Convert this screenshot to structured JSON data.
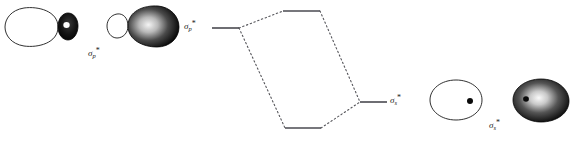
{
  "figure": {
    "background_color": "#ffffff",
    "width": 575,
    "height": 141,
    "stroke_color": "#1a1a1a",
    "dash_color": "#55555a",
    "fill_dark": "#0a0a0a",
    "fill_light": "#ffffff"
  },
  "labels": {
    "orbital_left": {
      "symbol": "σ",
      "subscript": "p",
      "superscript": "*",
      "text": "σp*"
    },
    "level_sigma_p_star": {
      "symbol": "σ",
      "subscript": "p",
      "superscript": "*",
      "text": "σp*"
    },
    "level_sigma_s_star": {
      "symbol": "σ",
      "subscript": "s",
      "superscript": "*",
      "text": "σs*"
    },
    "orbital_right": {
      "symbol": "σ",
      "subscript": "s",
      "superscript": "*",
      "text": "σs*"
    }
  },
  "orbitals": [
    {
      "name": "sigma-p-star-orbital-outline",
      "style": "outline",
      "description": "large white teardrop lobe pointing right joined to small black lobe with white nucleus dot",
      "big_lobe_fill": "#ffffff",
      "small_lobe_fill": "#0a0a0a",
      "nucleus_fill": "#ffffff"
    },
    {
      "name": "sigma-p-star-orbital-shaded",
      "style": "shaded",
      "description": "small white lobe at left joined to large black shaded teardrop pointing right",
      "big_lobe_fill": "#0a0a0a",
      "small_lobe_fill": "#ffffff",
      "nucleus_fill": "#ffffff"
    },
    {
      "name": "sigma-s-star-orbital-outline",
      "style": "outline",
      "description": "white egg shaped orbital outline with black nucleus dot at right",
      "big_lobe_fill": "#ffffff",
      "nucleus_fill": "#0a0a0a"
    },
    {
      "name": "sigma-s-star-orbital-shaded",
      "style": "shaded",
      "description": "black shaded egg shaped orbital with light highlight and black nucleus dot at left",
      "big_lobe_fill": "#0a0a0a",
      "nucleus_fill": "#0a0a0a"
    }
  ],
  "energy_diagram": {
    "type": "correlation-diagram",
    "levels": [
      {
        "name": "level-sigma-p-star",
        "x1": 212,
        "x2": 239,
        "y": 28,
        "label": "σp*"
      },
      {
        "name": "level-top",
        "x1": 283,
        "x2": 320,
        "y": 11,
        "label": ""
      },
      {
        "name": "level-bottom",
        "x1": 285,
        "x2": 321,
        "y": 128,
        "label": ""
      },
      {
        "name": "level-sigma-s-star",
        "x1": 360,
        "x2": 387,
        "y": 102,
        "label": "σs*"
      }
    ],
    "connectors": [
      {
        "name": "connector-sp-to-top",
        "x1": 239,
        "y1": 28,
        "x2": 283,
        "y2": 11,
        "style": "dotted"
      },
      {
        "name": "connector-sp-to-bottom",
        "x1": 239,
        "y1": 28,
        "x2": 285,
        "y2": 128,
        "style": "dotted"
      },
      {
        "name": "connector-top-to-ss",
        "x1": 320,
        "y1": 11,
        "x2": 360,
        "y2": 102,
        "style": "dotted"
      },
      {
        "name": "connector-bottom-to-ss",
        "x1": 321,
        "y1": 128,
        "x2": 360,
        "y2": 102,
        "style": "dotted"
      }
    ]
  }
}
